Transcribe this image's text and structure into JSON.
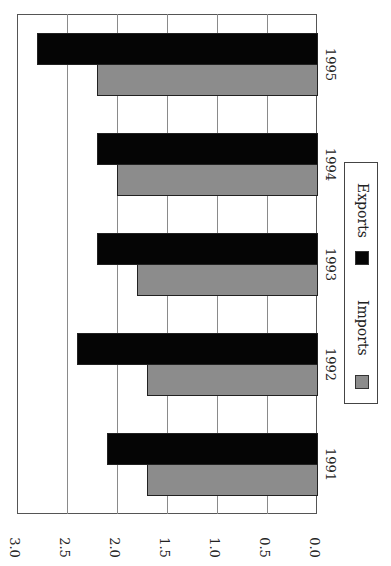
{
  "chart_data": {
    "type": "bar",
    "orientation": "horizontal-rotated",
    "title": "",
    "xlabel": "",
    "ylabel": "",
    "categories": [
      "1991",
      "1992",
      "1993",
      "1994",
      "1995"
    ],
    "series": [
      {
        "name": "Imports",
        "color": "#8c8c8c",
        "values": [
          1.7,
          1.7,
          1.8,
          2.0,
          2.2
        ]
      },
      {
        "name": "Exports",
        "color": "#050505",
        "values": [
          2.1,
          2.4,
          2.2,
          2.2,
          2.8
        ]
      }
    ],
    "value_axis": {
      "ticks": [
        "0.0",
        "0.5",
        "1.0",
        "1.5",
        "2.0",
        "2.5",
        "3.0"
      ],
      "range": [
        0,
        3.0
      ]
    },
    "grid": true,
    "legend": {
      "position": "right",
      "entries": [
        "Imports",
        "Exports"
      ]
    }
  },
  "legend": {
    "imports": "Imports",
    "exports": "Exports"
  },
  "ticks": [
    "0.0",
    "0.5",
    "1.0",
    "1.5",
    "2.0",
    "2.5",
    "3.0"
  ],
  "categories": [
    "1991",
    "1992",
    "1993",
    "1994",
    "1995"
  ]
}
